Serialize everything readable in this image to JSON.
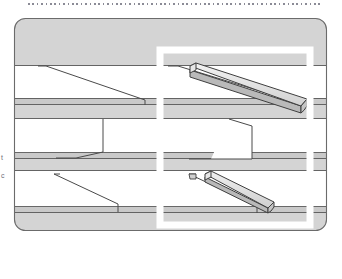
{
  "figure": {
    "title_rule": "dotted-horizontal-rule",
    "kind": "geological-cross-section",
    "caption_fragments": [
      "t",
      "c"
    ]
  },
  "panel": {
    "shape": "rounded-rectangle",
    "x": 14,
    "y": 18,
    "width": 313,
    "height": 213,
    "corner_radius": 11,
    "fill": "#d4d4d4",
    "stroke": "#6b6b6b",
    "stroke_width": 1
  },
  "highlight_frame": {
    "label": "white-highlight-frame",
    "x": 160,
    "y": 50,
    "width": 150,
    "height": 175,
    "stroke": "#ffffff",
    "stroke_width": 7,
    "fill": "none"
  },
  "colors": {
    "background": "#ffffff",
    "panel_fill": "#d4d4d4",
    "stratum_light": "#ffffff",
    "stratum_mid": "#d4d4d4",
    "stratum_dark": "#c2c2c2",
    "line": "#4a4a4a",
    "line_soft": "#6b6b6b",
    "bar_top": "#efefef",
    "bar_face": "#d9d9d9",
    "bar_side": "#b5b5b5",
    "frame": "#ffffff",
    "dots": "#8b8b96",
    "text": "#6e6e78"
  },
  "strata": [
    {
      "name": "stratum-1-overburden",
      "y": 19,
      "height": 46,
      "fill": "#d4d4d4"
    },
    {
      "name": "stratum-2-void-upper",
      "y": 65,
      "height": 33,
      "fill": "#ffffff"
    },
    {
      "name": "stratum-3-seam-thin",
      "y": 98,
      "height": 7,
      "fill": "#c9c9c9"
    },
    {
      "name": "stratum-4-seam-band",
      "y": 105,
      "height": 14,
      "fill": "#d4d4d4"
    },
    {
      "name": "stratum-5-void-mid",
      "y": 119,
      "height": 34,
      "fill": "#ffffff"
    },
    {
      "name": "stratum-6-seam-thin",
      "y": 153,
      "height": 6,
      "fill": "#c9c9c9"
    },
    {
      "name": "stratum-7-seam-band",
      "y": 159,
      "height": 12,
      "fill": "#d4d4d4"
    },
    {
      "name": "stratum-8-void-lower",
      "y": 171,
      "height": 36,
      "fill": "#ffffff"
    },
    {
      "name": "stratum-9-seam-thin",
      "y": 207,
      "height": 6,
      "fill": "#c9c9c9"
    },
    {
      "name": "stratum-10-basement",
      "y": 213,
      "height": 17,
      "fill": "#d4d4d4"
    }
  ],
  "faults": [
    {
      "name": "fault-line-upper-left",
      "points": "38,66 46,66 145,101 145,105"
    },
    {
      "name": "fault-line-upper-right",
      "points": "168,66 176,66 300,104 300,108"
    },
    {
      "name": "fault-line-mid-left",
      "points": "103,119 103,153 75,158 56,158"
    },
    {
      "name": "fault-line-mid-right",
      "points": "229,119 243,126 243,159 210,159 190,159"
    },
    {
      "name": "fault-line-lower-left",
      "points": "59,174 54,174 118,205 118,212"
    },
    {
      "name": "fault-line-lower-right",
      "points": "194,174 188,174 258,207 258,213"
    }
  ],
  "bars_3d": [
    {
      "name": "extruded-bar-upper",
      "orientation": "descending-right",
      "start": [
        190,
        66
      ],
      "end": [
        301,
        102
      ],
      "thickness": 9,
      "has_rounded_end": true
    },
    {
      "name": "extruded-bar-lower",
      "orientation": "descending-right",
      "start": [
        205,
        174
      ],
      "end": [
        268,
        205
      ],
      "thickness": 8,
      "has_rounded_end": true
    }
  ],
  "wedge": {
    "name": "tapered-wedge-mid-right",
    "points": "229,120 253,127 253,159 215,159",
    "fill": "#ffffff"
  }
}
